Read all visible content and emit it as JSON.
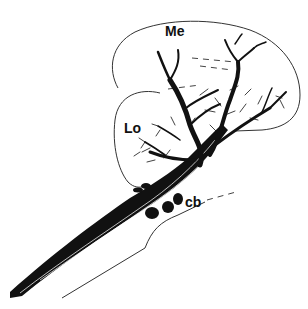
{
  "figure": {
    "type": "neuroanatomical line drawing",
    "labels": {
      "medulla": "Me",
      "lobula": "Lo",
      "cell_bodies": "cb"
    },
    "colors": {
      "background": "#ffffff",
      "ink": "#111111",
      "outline": "#333333"
    }
  }
}
